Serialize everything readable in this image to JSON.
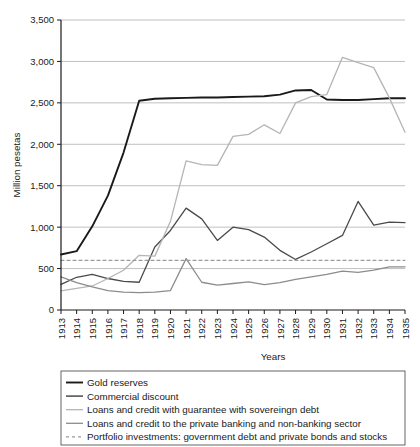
{
  "chart_data": {
    "type": "line",
    "title": "",
    "xlabel": "Years",
    "ylabel": "Million pesetas",
    "xlim": [
      1913,
      1935
    ],
    "ylim": [
      0,
      3500
    ],
    "ytick_step": 500,
    "grid": true,
    "legend_position": "below",
    "x": [
      1913,
      1914,
      1915,
      1916,
      1917,
      1918,
      1919,
      1920,
      1921,
      1922,
      1923,
      1924,
      1925,
      1926,
      1927,
      1928,
      1929,
      1930,
      1931,
      1932,
      1933,
      1934,
      1935
    ],
    "categories": [
      "1913",
      "1914",
      "1915",
      "1916",
      "1917",
      "1918",
      "1919",
      "1920",
      "1921",
      "1922",
      "1923",
      "1924",
      "1925",
      "1926",
      "1927",
      "1928",
      "1929",
      "1930",
      "1931",
      "1932",
      "1933",
      "1934",
      "1935"
    ],
    "series": [
      {
        "name": "Gold reserves",
        "color": "#1a1a1a",
        "width": 1.9,
        "dash": "none",
        "values": [
          670,
          710,
          1010,
          1380,
          1900,
          2525,
          2550,
          2555,
          2560,
          2565,
          2565,
          2570,
          2575,
          2580,
          2600,
          2650,
          2655,
          2540,
          2535,
          2535,
          2545,
          2555,
          2555
        ]
      },
      {
        "name": "Commercial discount",
        "color": "#4a4a4a",
        "width": 1.3,
        "dash": "none",
        "values": [
          310,
          395,
          430,
          380,
          345,
          335,
          760,
          960,
          1230,
          1100,
          840,
          1000,
          970,
          880,
          720,
          610,
          700,
          800,
          900,
          1310,
          1025,
          1060,
          1055
        ]
      },
      {
        "name": "Loans and credit with guarantee with sovereingn debt",
        "color": "#b5b5b5",
        "width": 1.3,
        "dash": "none",
        "values": [
          230,
          260,
          290,
          380,
          480,
          660,
          650,
          1070,
          1800,
          1755,
          1745,
          2095,
          2120,
          2235,
          2130,
          2500,
          2575,
          2600,
          3050,
          2985,
          2925,
          2560,
          2145
        ]
      },
      {
        "name": "Loans and credit to the private banking and non-banking sector",
        "color": "#8c8c8c",
        "width": 1.3,
        "dash": "none",
        "values": [
          400,
          330,
          280,
          235,
          215,
          210,
          215,
          235,
          620,
          335,
          300,
          320,
          340,
          305,
          330,
          370,
          400,
          430,
          470,
          455,
          480,
          520,
          520
        ]
      },
      {
        "name": "Portfolio investments: government debt and private bonds and stocks",
        "color": "#9a9a9a",
        "width": 1.2,
        "dash": "3,3",
        "values": [
          600,
          600,
          600,
          600,
          600,
          600,
          600,
          600,
          600,
          600,
          600,
          600,
          600,
          600,
          600,
          600,
          600,
          600,
          600,
          600,
          600,
          600,
          600
        ]
      }
    ],
    "ytick_labels": [
      "0",
      "500",
      "1,000",
      "1,500",
      "2,000",
      "2,500",
      "3,000",
      "3,500"
    ],
    "ytick_values": [
      0,
      500,
      1000,
      1500,
      2000,
      2500,
      3000,
      3500
    ]
  },
  "legend": {
    "items": [
      {
        "label": "Gold reserves",
        "color": "#1a1a1a",
        "dash": "none",
        "width": 1.9
      },
      {
        "label": "Commercial discount",
        "color": "#4a4a4a",
        "dash": "none",
        "width": 1.5
      },
      {
        "label": "Loans and credit with guarantee with sovereingn debt",
        "color": "#b5b5b5",
        "dash": "none",
        "width": 1.3
      },
      {
        "label": "Loans and credit to the private banking and non-banking sector",
        "color": "#8c8c8c",
        "dash": "none",
        "width": 1.3
      },
      {
        "label": "Portfolio investments: government debt and private bonds and stocks",
        "color": "#9a9a9a",
        "dash": "3,3",
        "width": 1.2
      }
    ]
  },
  "colors": {
    "grid": "#b0b0b0",
    "axis": "#1a1a1a",
    "background": "#ffffff",
    "legend_border": "#555555"
  }
}
